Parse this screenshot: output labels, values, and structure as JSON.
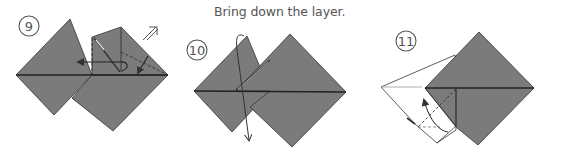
{
  "instruction": {
    "text": "Bring down the layer."
  },
  "colors": {
    "paper_gray": "#7b7b7b",
    "paper_white": "#ffffff",
    "outline": "#333333",
    "text": "#555555"
  },
  "steps": [
    {
      "number": "9",
      "label": "9",
      "description": "Two overlapping squares; right square flap squash-folded with dashed fold lines and leftward arrow; double arrow (push) symbol at top right"
    },
    {
      "number": "10",
      "label": "10",
      "description": "Two overlapping squares; curved arrow bringing down the layer"
    },
    {
      "number": "11",
      "label": "11",
      "description": "Single gray square with white flap to left; dashed fold line and upward arrow"
    }
  ]
}
